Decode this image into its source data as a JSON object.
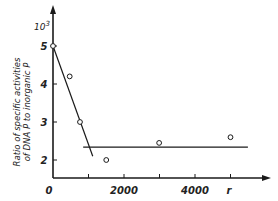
{
  "chart_data": {
    "type": "scatter",
    "title": "",
    "xlabel": "r",
    "ylabel": "Ratio of specific activities of DNA P to inorganic P",
    "ylabel_lines": [
      "Ratio of specific activities",
      "of DNA  P  to inorganic  P"
    ],
    "y_multiplier": "10",
    "y_multiplier_exp": "3",
    "xlim": [
      0,
      5900
    ],
    "ylim": [
      1.5,
      6.0
    ],
    "x_ticks": [
      0,
      1000,
      2000,
      3000,
      4000,
      5000
    ],
    "x_tick_labels": [
      {
        "value": 0,
        "label": "0"
      },
      {
        "value": 2000,
        "label": "2000"
      },
      {
        "value": 4000,
        "label": "4000"
      }
    ],
    "y_ticks": [
      2,
      3,
      4,
      5
    ],
    "y_tick_labels": [
      "2",
      "3",
      "4",
      "5"
    ],
    "grid": false,
    "legend": null,
    "series": [
      {
        "name": "measurements",
        "marker": "open-circle",
        "x": [
          0,
          470,
          760,
          1500,
          2990,
          5000
        ],
        "y": [
          5.0,
          4.2,
          3.0,
          2.0,
          2.45,
          2.6
        ]
      }
    ],
    "fit_lines": [
      {
        "name": "initial-decline",
        "x": [
          0,
          1120
        ],
        "y": [
          5.0,
          2.1
        ]
      },
      {
        "name": "plateau",
        "x": [
          850,
          5490
        ],
        "y": [
          2.34,
          2.34
        ]
      }
    ]
  }
}
